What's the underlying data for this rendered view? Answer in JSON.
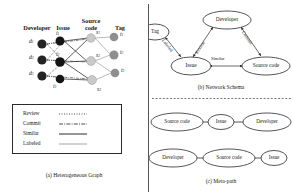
{
  "figure": {
    "panels": [
      {
        "id": "a",
        "caption": "(a) Heterogeneous Graph"
      },
      {
        "id": "b",
        "caption": "(b) Network Schema"
      },
      {
        "id": "c",
        "caption": "(c) Meta-path"
      }
    ]
  },
  "heterogeneous_graph": {
    "columns": [
      {
        "name": "developer",
        "title": "Developer"
      },
      {
        "name": "issue",
        "title": "Issue"
      },
      {
        "name": "source_code",
        "title_line1": "Source",
        "title_line2": "code"
      },
      {
        "name": "tag",
        "title": "Tag"
      }
    ],
    "nodes": {
      "developer": [
        {
          "id": "d1",
          "label": "d",
          "sub": "1",
          "color": "#242424"
        },
        {
          "id": "d2",
          "label": "d",
          "sub": "2",
          "color": "#242424"
        },
        {
          "id": "d3",
          "label": "d",
          "sub": "3",
          "color": "#242424"
        }
      ],
      "issue": [
        {
          "id": "i1",
          "label": "i",
          "sub": "1",
          "color": "#141414"
        },
        {
          "id": "i2",
          "label": "i",
          "sub": "2",
          "color": "#141414"
        },
        {
          "id": "i3",
          "label": "i",
          "sub": "3",
          "color": "#141414"
        }
      ],
      "source_code": [
        {
          "id": "s1",
          "label": "s",
          "sub": "1",
          "color": "#c9c9c9"
        },
        {
          "id": "s2",
          "label": "s",
          "sub": "2",
          "color": "#c9c9c9"
        },
        {
          "id": "s3",
          "label": "s",
          "sub": "3",
          "color": "#c9c9c9"
        }
      ],
      "tag": [
        {
          "id": "t1",
          "label": "t",
          "sub": "1",
          "color": "#8e8e8e"
        },
        {
          "id": "t2",
          "label": "t",
          "sub": "2",
          "color": "#8e8e8e"
        },
        {
          "id": "t3",
          "label": "t",
          "sub": "3",
          "color": "#8e8e8e"
        }
      ]
    },
    "legend": [
      {
        "name": "review",
        "label": "Review",
        "style": "dotted",
        "color": "#3a3a3a"
      },
      {
        "name": "commit",
        "label": "Commit",
        "style": "dash-dot",
        "color": "#3a3a3a"
      },
      {
        "name": "similar",
        "label": "Similar",
        "style": "solid",
        "color": "#2b2b2b"
      },
      {
        "name": "labeled",
        "label": "Labeled",
        "style": "solid",
        "color": "#a5a5a5"
      }
    ]
  },
  "network_schema": {
    "nodes": [
      {
        "name": "tag",
        "label": "Tag"
      },
      {
        "name": "developer",
        "label": "Developer"
      },
      {
        "name": "issue",
        "label": "Issue"
      },
      {
        "name": "source_code",
        "label": "Source code"
      }
    ],
    "edges": [
      {
        "name": "labeled",
        "label": "Labeled",
        "from": "tag",
        "to": "issue"
      },
      {
        "name": "review",
        "label": "Review",
        "from": "issue",
        "to": "developer"
      },
      {
        "name": "commit",
        "label": "Commit",
        "from": "developer",
        "to": "source_code"
      },
      {
        "name": "similar",
        "label": "Similar",
        "from": "issue",
        "to": "source_code"
      }
    ]
  },
  "meta_path": {
    "paths": [
      {
        "name": "path-1",
        "nodes": [
          "Source code",
          "Issue",
          "Developer"
        ]
      },
      {
        "name": "path-2",
        "nodes": [
          "Developer",
          "Source code",
          "Issue"
        ]
      }
    ]
  }
}
